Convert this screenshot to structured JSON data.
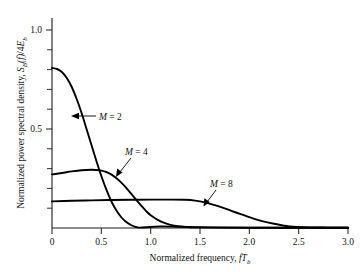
{
  "figure": {
    "background_color": "#ffffff",
    "curve_color": "#000000",
    "axis_color": "#1a1a1a"
  },
  "axes": {
    "x_title_plain": "Normalized frequency, ",
    "x_title_symbol_f": "f",
    "x_title_symbol_T": "T",
    "x_title_symbol_sub": "b",
    "y_title_plain": "Normalized power spectral density, ",
    "y_title_symbol_S": "S",
    "y_title_symbol_S_sub": "B",
    "y_title_symbol_f": "(f)",
    "y_title_symbol_div": "/4",
    "y_title_symbol_E": "E",
    "y_title_symbol_E_sub": "b",
    "x_ticks": [
      "0",
      "0.5",
      "1.0",
      "1.5",
      "2.0",
      "2.5",
      "3.0"
    ],
    "y_ticks": [
      "0.5",
      "1.0"
    ]
  },
  "annotations": [
    {
      "id": "m2",
      "label_m": "M",
      "label_eq": " = 2"
    },
    {
      "id": "m4",
      "label_m": "M",
      "label_eq": " = 4"
    },
    {
      "id": "m8",
      "label_m": "M",
      "label_eq": " = 8"
    }
  ],
  "chart_data": {
    "type": "line",
    "title": "",
    "xlabel": "Normalized frequency, fTb",
    "ylabel": "Normalized power spectral density, SB(f)/4Eb",
    "xlim": [
      0,
      3.0
    ],
    "ylim": [
      0,
      1.05
    ],
    "xticks": [
      0,
      0.5,
      1.0,
      1.5,
      2.0,
      2.5,
      3.0
    ],
    "yticks": [
      0.5,
      1.0
    ],
    "yticks_minor": [
      0.1,
      0.2,
      0.3,
      0.4,
      0.6,
      0.7,
      0.8,
      0.9
    ],
    "grid": false,
    "legend": "inline-annotations",
    "series": [
      {
        "name": "M = 2",
        "x": [
          0.0,
          0.05,
          0.1,
          0.15,
          0.2,
          0.25,
          0.3,
          0.35,
          0.4,
          0.45,
          0.5,
          0.55,
          0.6,
          0.65,
          0.7,
          0.75,
          0.8,
          0.85,
          0.88,
          0.95,
          1.1,
          1.3,
          1.6,
          2.0,
          2.5,
          3.0
        ],
        "values": [
          0.8,
          0.795,
          0.78,
          0.75,
          0.705,
          0.645,
          0.575,
          0.495,
          0.415,
          0.335,
          0.26,
          0.193,
          0.135,
          0.09,
          0.055,
          0.031,
          0.015,
          0.005,
          0.002,
          0.004,
          0.008,
          0.006,
          0.003,
          0.002,
          0.001,
          0.001
        ]
      },
      {
        "name": "M = 4",
        "x": [
          0.0,
          0.1,
          0.2,
          0.3,
          0.4,
          0.45,
          0.5,
          0.55,
          0.6,
          0.65,
          0.7,
          0.75,
          0.8,
          0.85,
          0.9,
          0.95,
          1.0,
          1.1,
          1.2,
          1.3,
          1.4,
          1.5,
          1.7,
          2.0,
          2.5,
          3.0
        ],
        "values": [
          0.268,
          0.275,
          0.283,
          0.289,
          0.291,
          0.29,
          0.287,
          0.28,
          0.268,
          0.25,
          0.228,
          0.202,
          0.173,
          0.143,
          0.114,
          0.087,
          0.064,
          0.033,
          0.016,
          0.008,
          0.004,
          0.003,
          0.002,
          0.001,
          0.001,
          0.001
        ]
      },
      {
        "name": "M = 8",
        "x": [
          0.0,
          0.2,
          0.4,
          0.6,
          0.8,
          1.0,
          1.2,
          1.35,
          1.45,
          1.55,
          1.65,
          1.75,
          1.85,
          1.95,
          2.05,
          2.15,
          2.25,
          2.35,
          2.45,
          2.6,
          2.8,
          3.0
        ],
        "values": [
          0.133,
          0.136,
          0.138,
          0.14,
          0.141,
          0.142,
          0.142,
          0.141,
          0.137,
          0.128,
          0.114,
          0.098,
          0.08,
          0.063,
          0.046,
          0.032,
          0.021,
          0.012,
          0.006,
          0.003,
          0.002,
          0.001
        ]
      }
    ]
  }
}
